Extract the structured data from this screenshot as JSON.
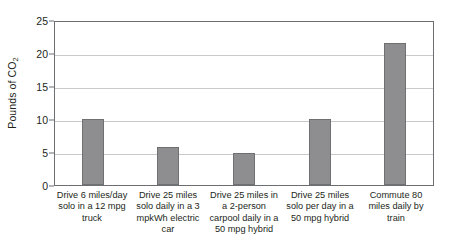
{
  "chart_data": {
    "type": "bar",
    "title": "",
    "xlabel": "",
    "ylabel": "Pounds of CO2",
    "ylabel_display": "Pounds of CO",
    "ylabel_subscript": "2",
    "ylim": [
      0,
      25
    ],
    "yticks": [
      0,
      5,
      10,
      15,
      20,
      25
    ],
    "ytick_labels": [
      "0",
      "5",
      "10",
      "15",
      "20",
      "25"
    ],
    "grid": true,
    "legend": "none",
    "bar_color": "#8e8e90",
    "bar_border_color": "#6f7072",
    "gridline_color": "#c9cacc",
    "axis_color": "#6d6e71",
    "categories": [
      "Drive 6 miles/day solo in a 12 mpg truck",
      "Drive 25 miles solo daily in a 3 mpkWh electric car",
      "Drive 25 miles in a 2-person carpool daily in a 50 mpg hybrid",
      "Drive 25 miles solo per day in a 50 mpg hybrid",
      "Commute 80 miles daily by train"
    ],
    "values": [
      10.0,
      5.8,
      4.9,
      10.0,
      21.5
    ]
  }
}
